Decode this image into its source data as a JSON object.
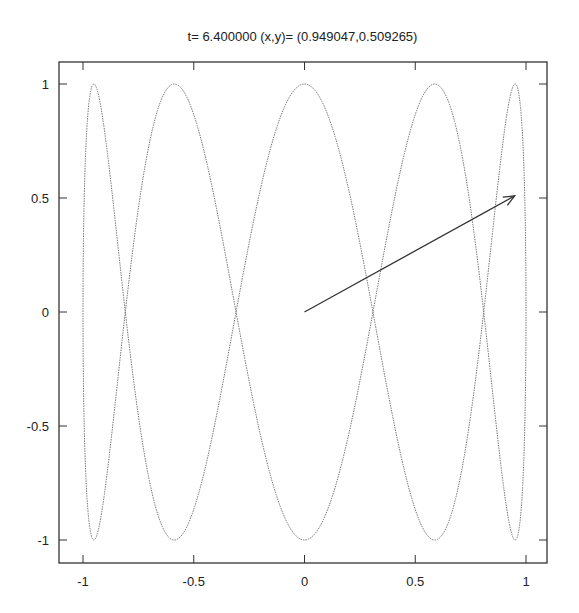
{
  "chart_data": {
    "type": "line",
    "title": "t= 6.400000 (x,y)= (0.949047,0.509265)",
    "xlabel": "",
    "ylabel": "",
    "xlim": [
      -1.1,
      1.1
    ],
    "ylim": [
      -1.1,
      1.1
    ],
    "grid": false,
    "xticks": [
      -1,
      -0.5,
      0,
      0.5,
      1
    ],
    "xtick_labels": [
      "-1",
      "-0.5",
      "0",
      "0.5",
      "1"
    ],
    "yticks": [
      -1,
      -0.5,
      0,
      0.5,
      1
    ],
    "ytick_labels": [
      "-1",
      "-0.5",
      "0",
      "0.5",
      "1"
    ],
    "series": [
      {
        "name": "lissajous curve",
        "style": "dotted",
        "parametric": "x=sin(t), y=cos(5t)",
        "t_range": [
          0,
          6.2832
        ]
      }
    ],
    "annotations": [
      {
        "type": "arrow",
        "from": [
          0,
          0
        ],
        "to": [
          0.949047,
          0.509265
        ]
      }
    ]
  },
  "colors": {
    "curve": "#777777",
    "arrow": "#333333",
    "frame": "#333333"
  }
}
